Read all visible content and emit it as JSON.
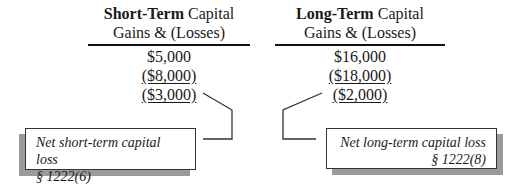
{
  "columns": [
    {
      "id": "short-term",
      "header_bold": "Short-Term",
      "header_rest": " Capital",
      "header_line2": "Gains & (Losses)",
      "values": [
        {
          "text": "$5,000",
          "underlined": false
        },
        {
          "text": "($8,000)",
          "underlined": true
        },
        {
          "text": "($3,000)",
          "underlined": true
        }
      ]
    },
    {
      "id": "long-term",
      "header_bold": "Long-Term",
      "header_rest": " Capital",
      "header_line2": "Gains & (Losses)",
      "values": [
        {
          "text": "$16,000",
          "underlined": false
        },
        {
          "text": "($18,000)",
          "underlined": true
        },
        {
          "text": "($2,000)",
          "underlined": true
        }
      ]
    }
  ],
  "callouts": [
    {
      "id": "net-short-term",
      "line1": "Net short-term capital loss",
      "line2": "§ 1222(6)"
    },
    {
      "id": "net-long-term",
      "line1": "Net long-term capital loss",
      "line2": "§ 1222(8)"
    }
  ],
  "colors": {
    "line": "#333333",
    "shadow": "#9a9a9a",
    "text": "#1a1a1a"
  }
}
